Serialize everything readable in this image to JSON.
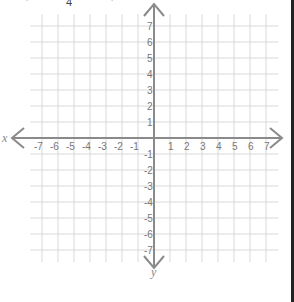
{
  "figure": {
    "type": "coordinate-plane",
    "top_fragments": [
      {
        "text": "'",
        "x": 26
      },
      {
        "text": "4",
        "x": 66
      },
      {
        "text": "'",
        "x": 111
      }
    ],
    "axis_labels": {
      "x": "x",
      "y": "y"
    },
    "x_ticks": [
      "-7",
      "-6",
      "-5",
      "-4",
      "-3",
      "-2",
      "-1",
      "1",
      "2",
      "3",
      "4",
      "5",
      "6",
      "7"
    ],
    "y_ticks": [
      "7",
      "6",
      "5",
      "4",
      "3",
      "2",
      "1",
      "-1",
      "-2",
      "-3",
      "-4",
      "-5",
      "-6",
      "-7"
    ],
    "x_range": [
      -7,
      7
    ],
    "y_range": [
      -7,
      7
    ],
    "grid": true,
    "colors": {
      "grid": "#d9d9d9",
      "axis": "#8a8a8a",
      "tick_text": "#777777",
      "border": "#222222"
    }
  }
}
